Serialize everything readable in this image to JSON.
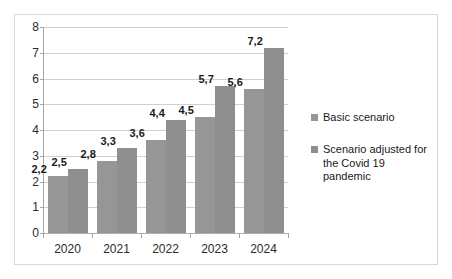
{
  "chart_data": {
    "type": "bar",
    "title": "",
    "subtitle": "",
    "xlabel": "",
    "ylabel": "",
    "categories": [
      "2020",
      "2021",
      "2022",
      "2023",
      "2024"
    ],
    "series": [
      {
        "name": "Basic scenario",
        "values": [
          2.2,
          2.8,
          3.6,
          4.5,
          5.6
        ],
        "labels": [
          "2,2",
          "2,8",
          "3,6",
          "4,5",
          "5,6"
        ],
        "color": "#969696"
      },
      {
        "name": "Scenario adjusted for the Covid 19 pandemic",
        "values": [
          2.5,
          3.3,
          4.4,
          5.7,
          7.2
        ],
        "labels": [
          "2,5",
          "3,3",
          "4,4",
          "5,7",
          "7,2"
        ],
        "color": "#8f8f8f"
      }
    ],
    "ylim": [
      0,
      8
    ],
    "ytick_labels": [
      "0",
      "1",
      "2",
      "3",
      "4",
      "5",
      "6",
      "7",
      "8"
    ],
    "ytick_values": [
      0,
      1,
      2,
      3,
      4,
      5,
      6,
      7,
      8
    ],
    "grid": true,
    "legend_position": "right",
    "legend": [
      {
        "label": "Basic scenario",
        "color": "#969696"
      },
      {
        "label": "Scenario adjusted for the Covid 19 pandemic",
        "color": "#8f8f8f"
      }
    ]
  },
  "legend_lines": {
    "series_0": [
      "Basic scenario"
    ],
    "series_1": [
      "Scenario adjusted for",
      "the Covid 19 pandemic"
    ]
  },
  "colors": {
    "series_basic": "#969696",
    "series_adjusted": "#8f8f8f",
    "gridline": "#d0d0d0",
    "axis": "#a6a6a6",
    "frame_border": "#d9d9d9",
    "background": "#ffffff",
    "text": "#1a1a1a"
  }
}
